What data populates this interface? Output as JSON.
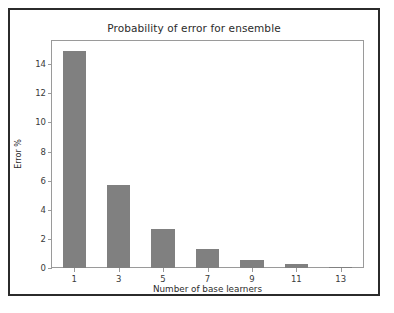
{
  "chart_data": {
    "type": "bar",
    "title": "Probability of error for ensemble",
    "xlabel": "Number of base learners",
    "ylabel": "Error %",
    "categories": [
      "1",
      "3",
      "5",
      "7",
      "9",
      "11",
      "13"
    ],
    "values": [
      14.9,
      5.7,
      2.65,
      1.3,
      0.55,
      0.28,
      0.08
    ],
    "xticklabels": [
      "1",
      "3",
      "5",
      "7",
      "9",
      "11",
      "13"
    ],
    "yticklabels": [
      "0",
      "2",
      "4",
      "6",
      "8",
      "10",
      "12",
      "14"
    ],
    "ytickvalues": [
      0,
      2,
      4,
      6,
      8,
      10,
      12,
      14
    ],
    "ylim": [
      0,
      15.6
    ],
    "xlim": [
      0,
      14
    ],
    "grid": false,
    "legend": null,
    "bar_color": "#808080",
    "frame_color": "#2b2b2b",
    "axes_color": "#9a9a9a"
  }
}
